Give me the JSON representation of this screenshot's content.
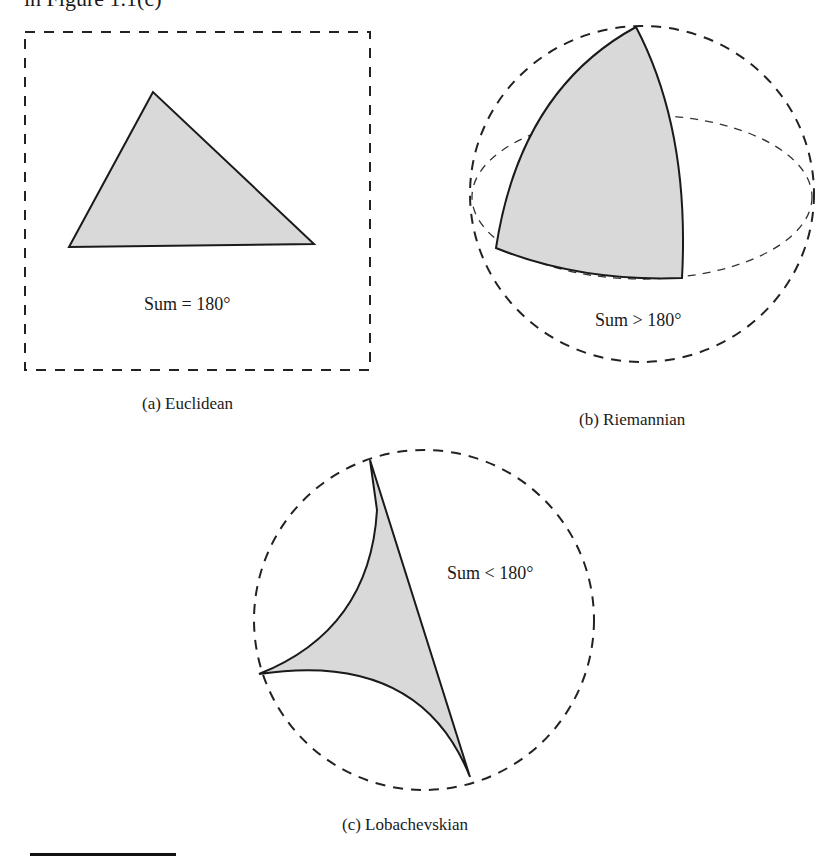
{
  "header_fragment": "in Figure 1.1(c)",
  "colors": {
    "stroke": "#1a1a1a",
    "fill": "#d9d9d9",
    "dash": "#333333"
  },
  "panels": [
    {
      "id": "a",
      "caption": "(a) Euclidean",
      "label": "Sum = 180°",
      "frame": "dashed-square",
      "shape": "planar triangle"
    },
    {
      "id": "b",
      "caption": "(b) Riemannian",
      "label": "Sum > 180°",
      "frame": "dashed-sphere",
      "shape": "spherical triangle"
    },
    {
      "id": "c",
      "caption": "(c) Lobachevskian",
      "label": "Sum < 180°",
      "frame": "dashed-disk",
      "shape": "hyperbolic triangle"
    }
  ]
}
